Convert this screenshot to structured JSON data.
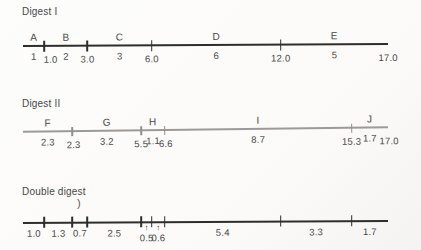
{
  "colors": {
    "text": "#474747",
    "dark_line": "#2d2d2d",
    "gray_line": "#9a9a9a",
    "gray_tick": "#8f8f8f",
    "stray": "#5a5a5a"
  },
  "icons": {
    "up_arrow": "↑"
  },
  "scale_max": 17,
  "axis": {
    "x_left": 23,
    "x_right": 388
  },
  "maps": [
    {
      "name": "digest-1",
      "title": "Digest I",
      "title_pos": {
        "x": 22,
        "y": 6
      },
      "line_y": 46,
      "tilt_deg": -0.3,
      "line_color_key": "dark_line",
      "line_thickness": 2,
      "tick_color_key": "dark_line",
      "tick_len": 11,
      "tick_rise": 5.5,
      "cuts": [
        1.0,
        3.0,
        6.0,
        12.0
      ],
      "fragments": [
        {
          "letter": "A",
          "size": "1",
          "from": 0,
          "to": 1.0
        },
        {
          "letter": "B",
          "size": "2",
          "from": 1.0,
          "to": 3.0
        },
        {
          "letter": "C",
          "size": "3",
          "from": 3.0,
          "to": 6.0
        },
        {
          "letter": "D",
          "size": "6",
          "from": 6.0,
          "to": 12.0
        },
        {
          "letter": "E",
          "size": "5",
          "from": 12.0,
          "to": 17.0
        }
      ],
      "position_labels": [
        {
          "pos": 1.0,
          "label": "1.0",
          "dx": 6
        },
        {
          "pos": 3.0,
          "label": "3.0",
          "dx": 0
        },
        {
          "pos": 6.0,
          "label": "6.0",
          "dx": 0
        },
        {
          "pos": 12.0,
          "label": "12.0",
          "dx": 0
        },
        {
          "pos": 17.0,
          "label": "17.0",
          "dx": 0
        }
      ]
    },
    {
      "name": "digest-2",
      "title": "Digest II",
      "title_pos": {
        "x": 22,
        "y": 98
      },
      "line_y": 132,
      "tilt_deg": -0.7,
      "line_color_key": "gray_line",
      "line_thickness": 1.3,
      "tick_color_key": "gray_tick",
      "tick_len": 9,
      "tick_rise": 4.5,
      "cuts": [
        2.3,
        5.5,
        6.6,
        15.3
      ],
      "fragments": [
        {
          "letter": "F",
          "size": "2.3",
          "from": 0,
          "to": 2.3
        },
        {
          "letter": "G",
          "size": "3.2",
          "from": 2.3,
          "to": 5.5
        },
        {
          "letter": "H",
          "size": "1.1",
          "from": 5.5,
          "to": 6.6
        },
        {
          "letter": "I",
          "size": "8.7",
          "from": 6.6,
          "to": 15.3
        },
        {
          "letter": "J",
          "size": "1.7",
          "from": 15.3,
          "to": 17.0
        }
      ],
      "position_labels": [
        {
          "pos": 2.3,
          "label": "2.3",
          "dx": 1
        },
        {
          "pos": 5.5,
          "label": "5.5",
          "dx": 0
        },
        {
          "pos": 6.6,
          "label": "6.6",
          "dx": 1
        },
        {
          "pos": 15.3,
          "label": "15.3",
          "dx": 0
        },
        {
          "pos": 17.0,
          "label": "17.0",
          "dx": 1
        }
      ]
    },
    {
      "name": "double-digest",
      "title": "Double digest",
      "title_pos": {
        "x": 22,
        "y": 186
      },
      "line_y": 223,
      "tilt_deg": -0.3,
      "line_color_key": "dark_line",
      "line_thickness": 2,
      "tick_color_key": "dark_line",
      "tick_len": 11,
      "tick_rise": 6,
      "cuts": [
        1.0,
        2.3,
        3.0,
        5.5,
        6.0,
        6.6,
        12.0,
        15.3
      ],
      "fragments": [
        {
          "letter": "",
          "size": "1.0",
          "from": 0,
          "to": 1.0
        },
        {
          "letter": "",
          "size": "1.3",
          "from": 1.0,
          "to": 2.3
        },
        {
          "letter": "",
          "size": "0.7",
          "from": 2.3,
          "to": 3.0
        },
        {
          "letter": "",
          "size": "2.5",
          "from": 3.0,
          "to": 5.5
        },
        {
          "letter": "",
          "size": "0.5",
          "from": 5.5,
          "to": 6.0,
          "dropped": true
        },
        {
          "letter": "",
          "size": "0.6",
          "from": 6.0,
          "to": 6.6,
          "dropped": true
        },
        {
          "letter": "",
          "size": "5.4",
          "from": 6.6,
          "to": 12.0
        },
        {
          "letter": "",
          "size": "3.3",
          "from": 12.0,
          "to": 15.3
        },
        {
          "letter": "",
          "size": "1.7",
          "from": 15.3,
          "to": 17.0
        }
      ],
      "position_labels": [],
      "stray_mark": {
        "glyph": ")",
        "x": 77,
        "y": 197
      }
    }
  ]
}
